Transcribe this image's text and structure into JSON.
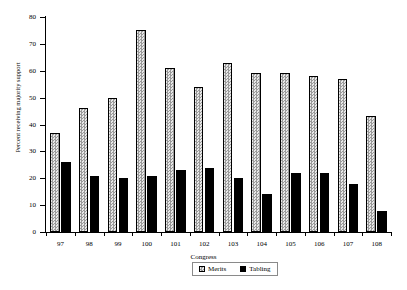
{
  "chart_data": {
    "type": "bar",
    "title": "",
    "xlabel": "Congress",
    "ylabel": "Percent receiving majority support",
    "categories": [
      "97",
      "98",
      "99",
      "100",
      "101",
      "102",
      "103",
      "104",
      "105",
      "106",
      "107",
      "108"
    ],
    "series": [
      {
        "name": "Merits",
        "values": [
          37,
          46,
          50,
          75,
          61,
          54,
          63,
          59,
          59,
          58,
          57,
          43
        ]
      },
      {
        "name": "Tabling",
        "values": [
          26,
          21,
          20,
          21,
          23,
          24,
          20,
          14,
          22,
          22,
          18,
          8
        ]
      }
    ],
    "ylim": [
      0,
      80
    ],
    "yticks": [
      0,
      10,
      20,
      30,
      40,
      50,
      60,
      70,
      80
    ],
    "grid": false,
    "legend_position": "bottom"
  },
  "legend": {
    "items": [
      {
        "label": "Merits",
        "swatch": "hatched-square-icon"
      },
      {
        "label": "Tabling",
        "swatch": "filled-square-icon"
      }
    ]
  }
}
